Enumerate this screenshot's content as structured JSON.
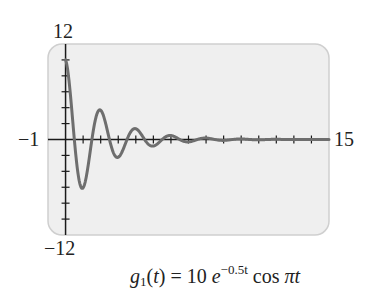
{
  "chart_data": {
    "type": "line",
    "title": "",
    "caption": "g1(t) = 10 e^(-0.5t) cos πt",
    "function": {
      "name": "g",
      "subscript": "1",
      "variable": "t",
      "amplitude": 10,
      "decay_rate": -0.5,
      "expression": "10 e^(-0.5t) cos(πt)"
    },
    "xlabel": "",
    "ylabel": "",
    "xlim": [
      -1,
      15
    ],
    "ylim": [
      -12,
      12
    ],
    "x_tick_step": 1,
    "y_tick_step": 2,
    "axis_labels": {
      "xmin": "−1",
      "xmax": "15",
      "ymin": "−12",
      "ymax": "12"
    },
    "grid": false,
    "legend": null,
    "series": [
      {
        "name": "g1(t)",
        "color": "#6e6e6e",
        "x": [
          0,
          0.5,
          1,
          1.5,
          2,
          2.5,
          3,
          3.5,
          4,
          4.5,
          5,
          6,
          7,
          8,
          9,
          10,
          15
        ],
        "values": [
          10,
          0,
          -6.07,
          0,
          3.68,
          0,
          -2.23,
          0,
          1.35,
          0,
          -0.82,
          0.5,
          -0.3,
          0.18,
          -0.11,
          0.07,
          0.0
        ]
      }
    ]
  },
  "labels": {
    "ymax": "12",
    "ymin": "−12",
    "xmin": "−1",
    "xmax": "15"
  },
  "caption": {
    "fn": "g",
    "sub": "1",
    "arg_open": "(",
    "var": "t",
    "arg_close": ")",
    "equals": " = 10 ",
    "base": "e",
    "exponent": "−0.5t",
    "cos": "cos",
    "pi": "π",
    "var2": "t"
  },
  "style": {
    "panel_bg": "#efefef",
    "panel_border": "#cfcfcf",
    "axis_color": "#1a1a1a",
    "curve_color": "#6e6e6e"
  }
}
